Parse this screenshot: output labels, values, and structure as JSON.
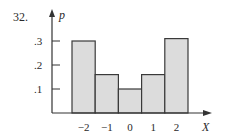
{
  "problem_number": "32.",
  "chart_data": {
    "type": "bar",
    "title": "",
    "xlabel": "X",
    "ylabel": "p",
    "categories": [
      "-2",
      "-1",
      "0",
      "1",
      "2"
    ],
    "values": [
      0.3,
      0.16,
      0.1,
      0.16,
      0.31
    ],
    "ylim": [
      0,
      0.35
    ],
    "yticks": [
      ".1",
      ".2",
      ".3"
    ],
    "ytick_values": [
      0.1,
      0.2,
      0.3
    ],
    "xtick_labels": [
      "−2",
      "−1",
      "0",
      "1",
      "2"
    ],
    "grid": false,
    "legend": null,
    "bar_fill": "#dcdcdc",
    "bar_stroke": "#3a3a3a"
  }
}
